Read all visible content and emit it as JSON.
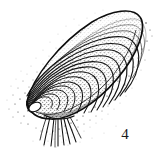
{
  "figure": {
    "number_label": "4",
    "caption": "",
    "medium": "pen-and-ink stipple line drawing",
    "background_color": "#ffffff",
    "ink_color": "#141414",
    "stipple_color": "#2b2b2b",
    "canvas": {
      "width": 158,
      "height": 151
    }
  },
  "illustration": {
    "title": "Mussel (bivalve mollusk) shell, oblique view",
    "orientation": "umbo at lower left, posterior margin at upper right, tilted about 40 degrees",
    "parts": [
      {
        "name": "shell-outline",
        "label": "Shell outline"
      },
      {
        "name": "umbo",
        "label": "Umbo (beak)"
      },
      {
        "name": "growth-rings",
        "label": "Concentric growth rings",
        "count": 13
      },
      {
        "name": "ventral-margin",
        "label": "Ventral margin"
      },
      {
        "name": "dorsal-margin",
        "label": "Dorsal margin"
      },
      {
        "name": "byssal-threads",
        "label": "Byssal threads (beard)",
        "count": 9
      },
      {
        "name": "stipple-shading",
        "label": "Stipple shading"
      }
    ]
  },
  "shell_geometry": {
    "umbo_point": [
      31,
      108
    ],
    "tip_point": [
      27,
      101
    ],
    "posterior_apex": [
      139,
      18
    ],
    "dorsal_curve_control": [
      78,
      7
    ],
    "ventral_curve_control": [
      86,
      118
    ],
    "ring_count": 13,
    "thread_origin": [
      57,
      117
    ],
    "thread_end_y": 146
  }
}
